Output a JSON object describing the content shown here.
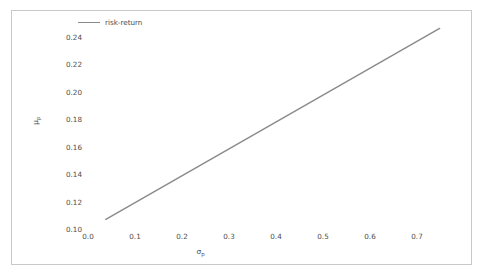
{
  "figure": {
    "background_color": "#ffffff",
    "frame_color": "#c9c9c9",
    "tick_label_color": "#4d4d4d"
  },
  "legend": {
    "position": "upper-left",
    "entries": [
      {
        "label": "risk-return",
        "color": "#8a8a8a"
      }
    ]
  },
  "axes": {
    "xlabel_sym": "σ",
    "xlabel_sub": "p",
    "ylabel_sym": "μ",
    "ylabel_sub": "p"
  },
  "chart_data": {
    "type": "line",
    "title": "",
    "xlabel": "σ_p",
    "ylabel": "μ_p",
    "grid": false,
    "legend_position": "upper left",
    "xlim": [
      -0.04,
      0.78
    ],
    "ylim": [
      0.094,
      0.252
    ],
    "xticks": [
      0.0,
      0.1,
      0.2,
      0.3,
      0.4,
      0.5,
      0.6,
      0.7
    ],
    "xtick_labels": [
      "0.0",
      "0.1",
      "0.2",
      "0.3",
      "0.4",
      "0.5",
      "0.6",
      "0.7"
    ],
    "yticks": [
      0.1,
      0.12,
      0.14,
      0.16,
      0.18,
      0.2,
      0.22,
      0.24
    ],
    "ytick_labels": [
      "0.10",
      "0.12",
      "0.14",
      "0.16",
      "0.18",
      "0.20",
      "0.22",
      "0.24"
    ],
    "series": [
      {
        "name": "risk-return",
        "color": "#8a8a8a",
        "linewidth": 1.4,
        "x": [
          0.0,
          0.75
        ],
        "y": [
          0.1,
          0.2486
        ]
      }
    ]
  }
}
